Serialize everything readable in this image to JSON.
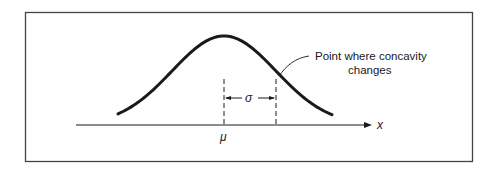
{
  "figure": {
    "annotation": {
      "line1": "Point where concavity",
      "line2": "changes"
    },
    "axis_label": "x",
    "mean_label": "μ",
    "sigma_label": "σ",
    "colors": {
      "stroke": "#1a1a1a",
      "frame": "#444444",
      "background": "#ffffff"
    }
  }
}
